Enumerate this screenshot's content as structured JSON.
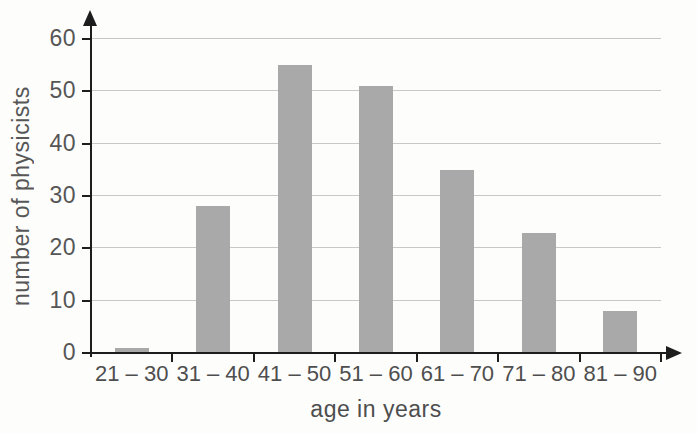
{
  "chart_data": {
    "type": "bar",
    "categories": [
      "21 – 30",
      "31 – 40",
      "41 – 50",
      "51 – 60",
      "61 – 70",
      "71 – 80",
      "81 – 90"
    ],
    "values": [
      1,
      28,
      55,
      51,
      35,
      23,
      8
    ],
    "title": "",
    "xlabel": "age in years",
    "ylabel": "number of physicists",
    "yticks": [
      0,
      10,
      20,
      30,
      40,
      50,
      60
    ],
    "ylim": [
      0,
      60
    ],
    "grid": "horizontal",
    "legend": "none",
    "colors": {
      "bar": "#a9a9a9",
      "gridline": "#c6c9c6",
      "axis": "#1d1d1d",
      "text": "#4e4e4e",
      "background": "#fdfdfc"
    }
  }
}
